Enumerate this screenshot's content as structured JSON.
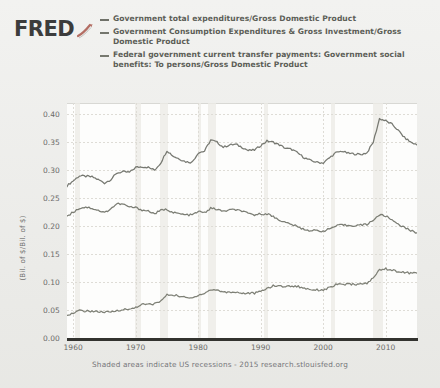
{
  "brand": {
    "wordmark": "FRED",
    "swoosh_icon": "fred-swoosh-icon",
    "swoosh_color": "#b03a2e"
  },
  "legend": {
    "items": [
      {
        "marker": "line-dash-icon",
        "color": "#6f7169",
        "label": "Government total expenditures/Gross Domestic Product"
      },
      {
        "marker": "line-dash-icon",
        "color": "#74766d",
        "label": "Government Consumption Expenditures & Gross Investment/Gross Domestic Product"
      },
      {
        "marker": "line-dash-icon",
        "color": "#77796f",
        "label": "Federal government current transfer payments: Government social benefits: To persons/Gross Domestic Product"
      }
    ]
  },
  "axes": {
    "y_title": "(Bil. of $/Bil. of $)",
    "y_ticks": [
      "0.40",
      "0.35",
      "0.30",
      "0.25",
      "0.20",
      "0.15",
      "0.10",
      "0.05",
      "0.00"
    ],
    "x_ticks": [
      "1960",
      "1970",
      "1980",
      "1990",
      "2000",
      "2010"
    ]
  },
  "footer": {
    "note": "Shaded areas indicate US recessions - 2015 research.stlouisfed.org"
  },
  "chart_data": {
    "type": "line",
    "title": "",
    "xlabel": "",
    "ylabel": "(Bil. of $/Bil. of $)",
    "xlim": [
      1959,
      2015
    ],
    "ylim": [
      0.0,
      0.42
    ],
    "grid": true,
    "legend_position": "top",
    "recessions": [
      [
        1960.3,
        1961.1
      ],
      [
        1969.9,
        1970.9
      ],
      [
        1973.9,
        1975.2
      ],
      [
        1980.0,
        1980.5
      ],
      [
        1981.5,
        1982.9
      ],
      [
        1990.5,
        1991.2
      ],
      [
        2001.2,
        2001.9
      ],
      [
        2007.9,
        2009.5
      ]
    ],
    "x": [
      1959,
      1960,
      1961,
      1962,
      1963,
      1964,
      1965,
      1966,
      1967,
      1968,
      1969,
      1970,
      1971,
      1972,
      1973,
      1974,
      1975,
      1976,
      1977,
      1978,
      1979,
      1980,
      1981,
      1982,
      1983,
      1984,
      1985,
      1986,
      1987,
      1988,
      1989,
      1990,
      1991,
      1992,
      1993,
      1994,
      1995,
      1996,
      1997,
      1998,
      1999,
      2000,
      2001,
      2002,
      2003,
      2004,
      2005,
      2006,
      2007,
      2008,
      2009,
      2010,
      2011,
      2012,
      2013,
      2014,
      2015
    ],
    "series": [
      {
        "name": "Government total expenditures/Gross Domestic Product",
        "color": "#6f7169",
        "values": [
          0.272,
          0.281,
          0.29,
          0.289,
          0.288,
          0.283,
          0.277,
          0.283,
          0.295,
          0.297,
          0.296,
          0.305,
          0.306,
          0.305,
          0.3,
          0.313,
          0.335,
          0.325,
          0.32,
          0.315,
          0.314,
          0.331,
          0.334,
          0.354,
          0.35,
          0.341,
          0.345,
          0.346,
          0.341,
          0.335,
          0.336,
          0.344,
          0.352,
          0.35,
          0.345,
          0.339,
          0.337,
          0.33,
          0.322,
          0.317,
          0.314,
          0.313,
          0.322,
          0.331,
          0.334,
          0.33,
          0.329,
          0.328,
          0.331,
          0.35,
          0.392,
          0.388,
          0.382,
          0.371,
          0.358,
          0.35,
          0.345
        ]
      },
      {
        "name": "Government Consumption Expenditures & Gross Investment/Gross Domestic Product",
        "color": "#74766d",
        "values": [
          0.218,
          0.225,
          0.232,
          0.234,
          0.232,
          0.228,
          0.224,
          0.231,
          0.24,
          0.239,
          0.234,
          0.233,
          0.229,
          0.227,
          0.222,
          0.228,
          0.23,
          0.224,
          0.222,
          0.22,
          0.22,
          0.226,
          0.224,
          0.232,
          0.23,
          0.226,
          0.229,
          0.229,
          0.227,
          0.222,
          0.22,
          0.222,
          0.222,
          0.217,
          0.211,
          0.206,
          0.203,
          0.198,
          0.194,
          0.192,
          0.192,
          0.191,
          0.195,
          0.2,
          0.202,
          0.201,
          0.201,
          0.202,
          0.203,
          0.211,
          0.22,
          0.218,
          0.211,
          0.204,
          0.197,
          0.192,
          0.188
        ]
      },
      {
        "name": "Federal government current transfer payments: Government social benefits: To persons/Gross Domestic Product",
        "color": "#77796f",
        "values": [
          0.042,
          0.044,
          0.049,
          0.048,
          0.048,
          0.047,
          0.046,
          0.046,
          0.049,
          0.051,
          0.051,
          0.055,
          0.06,
          0.06,
          0.061,
          0.066,
          0.077,
          0.077,
          0.075,
          0.072,
          0.071,
          0.077,
          0.08,
          0.086,
          0.086,
          0.082,
          0.082,
          0.082,
          0.08,
          0.08,
          0.08,
          0.083,
          0.089,
          0.093,
          0.093,
          0.092,
          0.093,
          0.092,
          0.089,
          0.087,
          0.086,
          0.086,
          0.09,
          0.095,
          0.096,
          0.096,
          0.096,
          0.096,
          0.098,
          0.107,
          0.122,
          0.124,
          0.121,
          0.119,
          0.117,
          0.116,
          0.116
        ]
      }
    ]
  }
}
